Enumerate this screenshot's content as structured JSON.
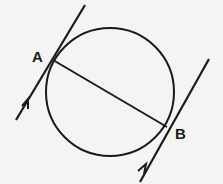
{
  "diagram": {
    "points": {
      "A": {
        "label": "A"
      },
      "B": {
        "label": "B"
      }
    },
    "elements": [
      "circle",
      "chord AB",
      "tangent at A with arrow",
      "tangent at B with arrow"
    ],
    "colors": {
      "ink": "#1a1a1a",
      "background": "#f4f4f2"
    }
  }
}
